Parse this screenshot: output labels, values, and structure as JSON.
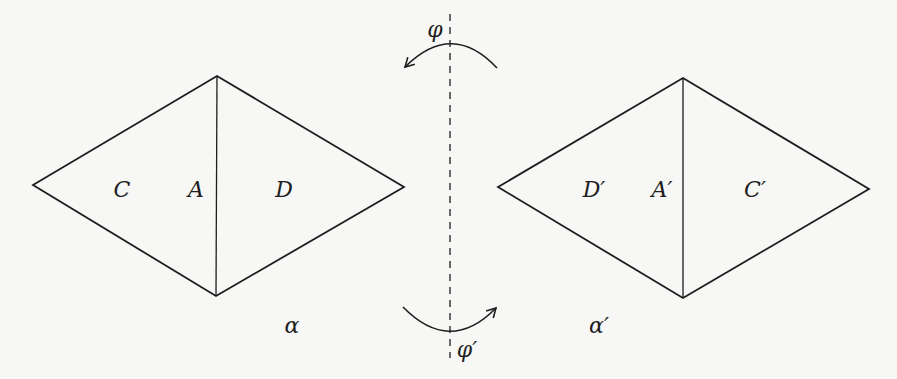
{
  "figure": {
    "left_rhombus": {
      "vertices": {
        "left": [
          33,
          185
        ],
        "top": [
          217,
          76
        ],
        "right": [
          404,
          187
        ],
        "bottom": [
          216,
          296
        ]
      },
      "labels": {
        "outer_left": "C",
        "center": "A",
        "outer_right": "D"
      },
      "caption": "α"
    },
    "right_rhombus": {
      "vertices": {
        "left": [
          498,
          187
        ],
        "top": [
          683,
          78
        ],
        "right": [
          869,
          189
        ],
        "bottom": [
          683,
          298
        ]
      },
      "labels": {
        "outer_left": "D′",
        "center": "A′",
        "outer_right": "C′"
      },
      "caption": "α′"
    },
    "axis": {
      "style": "dashed",
      "x": 450,
      "y_start": 14,
      "y_end": 358
    },
    "rotation_top": {
      "label": "φ",
      "direction": "counterclockwise"
    },
    "rotation_bottom": {
      "label": "φ′",
      "direction": "clockwise"
    },
    "colors": {
      "stroke": "#1e1e1e",
      "background": "#f7f7f5"
    }
  }
}
